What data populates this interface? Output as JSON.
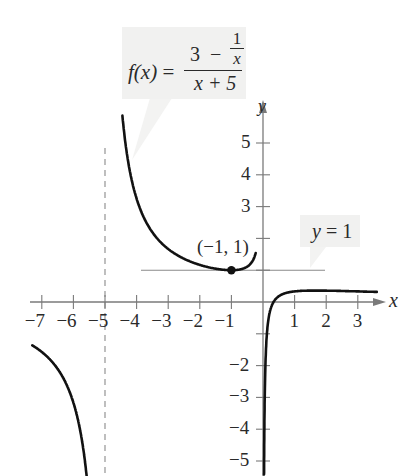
{
  "chart_data": {
    "type": "line",
    "title": "",
    "function": "f(x) = (3 - 1/x) / (x + 5)",
    "formula_label": {
      "lhs": "f(x)",
      "equals": "=",
      "numerator_lead": "3",
      "numerator_op": "−",
      "inner_fraction_num": "1",
      "inner_fraction_den": "x",
      "denominator": "x + 5"
    },
    "xlabel": "x",
    "ylabel": "y",
    "xlim": [
      -7.6,
      3.9
    ],
    "ylim": [
      -5.5,
      5.8
    ],
    "x_ticks": [
      -7,
      -6,
      -5,
      -4,
      -3,
      -2,
      -1,
      1,
      2,
      3
    ],
    "x_tick_labels": [
      "−7",
      "−6",
      "−5",
      "−4",
      "−3",
      "−2",
      "−1",
      "1",
      "2",
      "3"
    ],
    "y_ticks": [
      5,
      4,
      3,
      2,
      1,
      -1,
      -2,
      -3,
      -4,
      -5
    ],
    "y_tick_labels": [
      "5",
      "4",
      "3",
      "",
      "",
      "",
      "−2",
      "−3",
      "−4",
      "−5"
    ],
    "grid": false,
    "series": [
      {
        "name": "branch x < -5",
        "x_range": [
          -7.3,
          -5.58
        ],
        "sample": [
          [
            -7.3,
            -1.36
          ],
          [
            -7,
            -1.57
          ],
          [
            -6,
            -3.17
          ],
          [
            -5.58,
            -5.48
          ]
        ]
      },
      {
        "name": "branch -5 < x < 0",
        "x_range": [
          -4.45,
          -0.23
        ],
        "sample": [
          [
            -4.4,
            5.38
          ],
          [
            -4,
            3.25
          ],
          [
            -3,
            1.67
          ],
          [
            -2,
            1.17
          ],
          [
            -1,
            1.0
          ],
          [
            -0.5,
            1.11
          ],
          [
            -0.3,
            1.35
          ],
          [
            -0.23,
            1.52
          ]
        ]
      },
      {
        "name": "branch x > 0",
        "x_range": [
          0.033,
          3.6
        ],
        "sample": [
          [
            0.05,
            -3.38
          ],
          [
            0.1,
            -1.37
          ],
          [
            0.3,
            -0.06
          ],
          [
            0.5,
            0.18
          ],
          [
            1,
            0.33
          ],
          [
            2,
            0.36
          ],
          [
            3,
            0.33
          ],
          [
            3.6,
            0.32
          ]
        ]
      }
    ],
    "asymptotes": [
      {
        "type": "vertical",
        "x": -5,
        "style": "dashed"
      },
      {
        "type": "vertical",
        "x": 0,
        "style": "axis"
      },
      {
        "type": "horizontal",
        "y": 1,
        "style": "solid-thin",
        "label": "y = 1"
      }
    ],
    "annotations": [
      {
        "point": [
          -1,
          1
        ],
        "text": "(−1, 1)",
        "marker": "filled-circle"
      }
    ]
  },
  "labels": {
    "x_axis": "x",
    "y_axis": "y",
    "point": "(−1, 1)",
    "asymptote_lhs": "y",
    "asymptote_rest": " = 1"
  },
  "colors": {
    "curve": "#111111",
    "axis": "#7a7a7a",
    "asymptote": "#8a8a8a",
    "callout_bg": "#f1f1f0",
    "text": "#2a2a2a"
  }
}
